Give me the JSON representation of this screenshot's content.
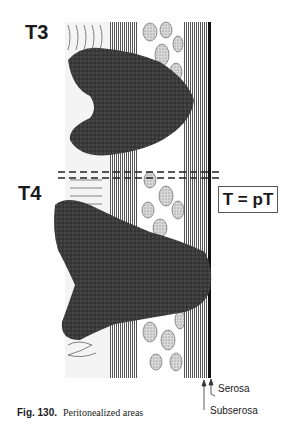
{
  "labels": {
    "t3": "T3",
    "t4": "T4",
    "formula": "T = pT",
    "serosa": "Serosa",
    "subserosa": "Subserosa"
  },
  "caption": {
    "number": "Fig. 130.",
    "text": "Peritonealized areas"
  },
  "colors": {
    "tumor": "#3a3a3a",
    "serosa_line": "#111111",
    "background": "#ffffff"
  }
}
